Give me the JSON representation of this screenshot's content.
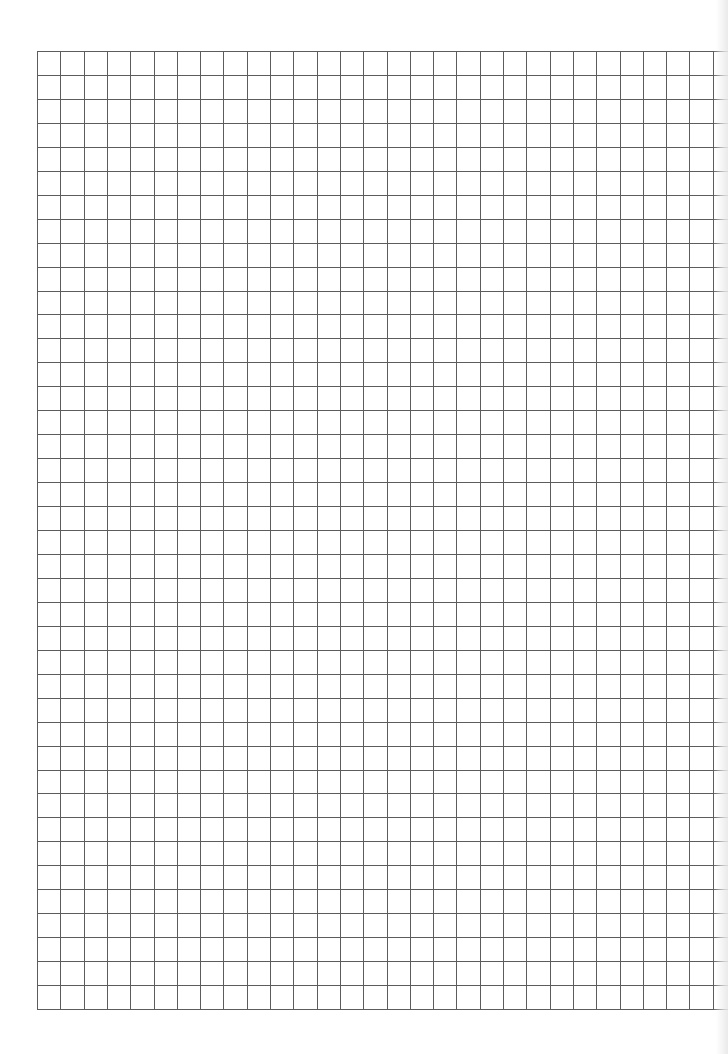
{
  "sheet": {
    "type": "graph-paper",
    "background_color": "#ffffff",
    "line_color": "#5c5c5c",
    "line_width": 1
  },
  "grid": {
    "origin_x": 37,
    "origin_y": 51,
    "columns": 29,
    "rows": 40,
    "cell_width": 23.3,
    "cell_height": 23.95,
    "right_extension_to": 728
  }
}
